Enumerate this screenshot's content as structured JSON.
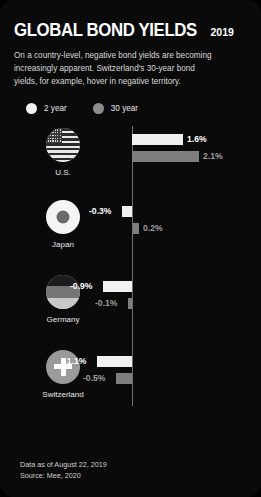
{
  "header": {
    "title": "GLOBAL BOND YIELDS",
    "year": "2019",
    "description": "On a country-level, negative bond yields are becoming increasingly apparent. Switzerland's 30-year bond yields, for example, hover in negative territory."
  },
  "legend": {
    "items": [
      {
        "label": "2 year",
        "color": "#f1f1f1",
        "icon": "legend-dot-white"
      },
      {
        "label": "30 year",
        "color": "#8d8d8d",
        "icon": "legend-dot-gray"
      }
    ]
  },
  "footer": {
    "line1": "Data as of August 22, 2019",
    "line2": "Source: Mee, 2020"
  },
  "chart_data": {
    "type": "bar",
    "title": "GLOBAL BOND YIELDS 2019",
    "xlabel": "",
    "ylabel": "",
    "orientation": "horizontal",
    "grid": false,
    "legend_position": "top-left",
    "zero_line": true,
    "xlim": [
      -1.2,
      2.2
    ],
    "categories": [
      "U.S.",
      "Japan",
      "Germany",
      "Switzerland"
    ],
    "series": [
      {
        "name": "2 year",
        "color": "#f1f1f1",
        "values": [
          1.6,
          -0.3,
          -0.9,
          -1.1
        ],
        "labels": [
          "1.6%",
          "-0.3%",
          "-0.9%",
          "-1.1%"
        ]
      },
      {
        "name": "30 year",
        "color": "#7e7e7e",
        "values": [
          2.1,
          0.2,
          -0.1,
          -0.5
        ],
        "labels": [
          "2.1%",
          "0.2%",
          "-0.1%",
          "-0.5%"
        ]
      }
    ],
    "countries": [
      {
        "name": "U.S.",
        "icon": "flag-us-icon",
        "two_year": "1.6%",
        "thirty_year": "2.1%"
      },
      {
        "name": "Japan",
        "icon": "flag-jp-icon",
        "two_year": "-0.3%",
        "thirty_year": "0.2%"
      },
      {
        "name": "Germany",
        "icon": "flag-de-icon",
        "two_year": "-0.9%",
        "thirty_year": "-0.1%"
      },
      {
        "name": "Switzerland",
        "icon": "flag-ch-icon",
        "two_year": "-1.1%",
        "thirty_year": "-0.5%"
      }
    ]
  }
}
